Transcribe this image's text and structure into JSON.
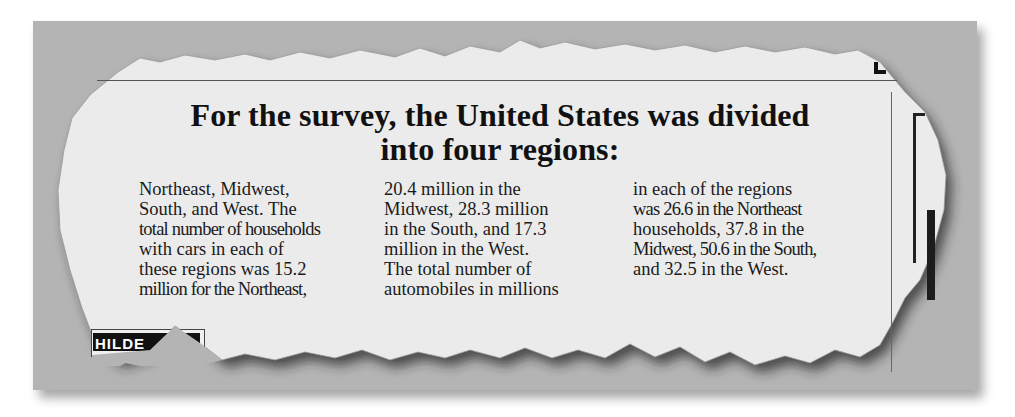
{
  "document": {
    "type": "torn newspaper clipping",
    "headline": {
      "line1": "For the survey, the United States was divided",
      "line2": "into four regions:"
    },
    "columns": [
      {
        "lines": [
          "Northeast, Midwest,",
          "South, and West. The",
          "total number of households",
          "with cars in each of",
          "these regions was 15.2",
          "million for the Northeast,"
        ]
      },
      {
        "lines": [
          "20.4 million in the",
          "Midwest, 28.3 million",
          "in the South, and 17.3",
          "million in the West.",
          "The total number of",
          "automobiles in millions"
        ]
      },
      {
        "lines": [
          "in each of the regions",
          "was 26.6 in the Northeast",
          "households, 37.8 in the",
          "Midwest, 50.6 in the South,",
          "and 32.5 in the West."
        ]
      }
    ],
    "clipped_fragment_text": "HILDE",
    "data_summary": {
      "regions": [
        "Northeast",
        "Midwest",
        "South",
        "West"
      ],
      "households_with_cars_millions": [
        15.2,
        20.4,
        28.3,
        17.3
      ],
      "automobiles_millions": [
        26.6,
        37.8,
        50.6,
        32.5
      ]
    }
  },
  "colors": {
    "background_gray": "#b4b4b4",
    "paper": "#ebebeb",
    "text": "#111111"
  }
}
